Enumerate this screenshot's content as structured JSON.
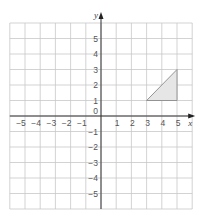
{
  "chart_data": {
    "type": "scatter",
    "title": "",
    "xlabel": "x",
    "ylabel": "y",
    "xlim": [
      -6,
      6
    ],
    "ylim": [
      -6,
      6
    ],
    "grid": true,
    "x_ticks": [
      -5,
      -4,
      -3,
      -2,
      -1,
      1,
      2,
      3,
      4,
      5
    ],
    "y_ticks": [
      5,
      4,
      3,
      2,
      1,
      -1,
      -2,
      -3,
      -4,
      -5
    ],
    "origin_label": "0",
    "shapes": [
      {
        "name": "triangle",
        "vertices": [
          [
            3,
            1
          ],
          [
            5,
            3
          ],
          [
            5,
            1
          ]
        ],
        "fill": "#e6e6e6",
        "stroke": "#8a8a8a"
      }
    ]
  }
}
